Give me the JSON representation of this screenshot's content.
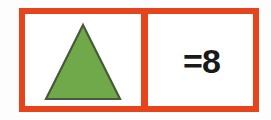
{
  "figure": {
    "kind": "pictograph-key-row",
    "background_color": "#fdfdfd",
    "frame_color": "#e8441c",
    "cell_background": "#ffffff"
  },
  "cells": {
    "shape_cell": {
      "icon_name": "green-triangle",
      "shape": "triangle",
      "fill_color": "#6fa94a",
      "outline_color": "#4a5a3a"
    },
    "value_cell": {
      "text": "=8",
      "text_color": "#1a1a1a"
    }
  },
  "key": {
    "symbol": "triangle",
    "equals_sign": "=",
    "count": 8
  }
}
